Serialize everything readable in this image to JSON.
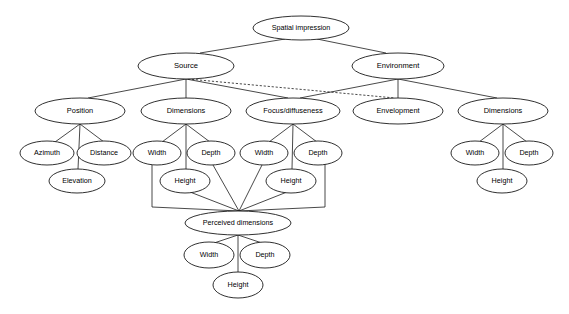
{
  "diagram": {
    "title": "Spatial impression",
    "type": "hierarchy-tree",
    "background_color": "#ffffff",
    "stroke_color": "#1a1a1a",
    "node_fill": "#ffffff",
    "nodes": [
      {
        "id": "spatial-impression",
        "label": "Spatial impression",
        "cx": 301,
        "cy": 28,
        "rx": 48,
        "ry": 12,
        "font_size": 7.2,
        "level": 0
      },
      {
        "id": "source",
        "label": "Source",
        "cx": 186,
        "cy": 66,
        "rx": 48,
        "ry": 13,
        "font_size": 7.6,
        "level": 1
      },
      {
        "id": "environment",
        "label": "Environment",
        "cx": 398,
        "cy": 66,
        "rx": 46,
        "ry": 13,
        "font_size": 7.6,
        "level": 1
      },
      {
        "id": "position",
        "label": "Position",
        "cx": 80,
        "cy": 111,
        "rx": 45,
        "ry": 13,
        "font_size": 7.4,
        "level": 2
      },
      {
        "id": "source-dimensions",
        "label": "Dimensions",
        "cx": 186,
        "cy": 111,
        "rx": 45,
        "ry": 13,
        "font_size": 7.4,
        "level": 2
      },
      {
        "id": "focus-diffuseness",
        "label": "Focus/diffuseness",
        "cx": 293,
        "cy": 111,
        "rx": 47,
        "ry": 13,
        "font_size": 7.4,
        "level": 2
      },
      {
        "id": "envelopment",
        "label": "Envelopment",
        "cx": 398,
        "cy": 111,
        "rx": 45,
        "ry": 13,
        "font_size": 7.4,
        "level": 2
      },
      {
        "id": "env-dimensions",
        "label": "Dimensions",
        "cx": 503,
        "cy": 111,
        "rx": 45,
        "ry": 13,
        "font_size": 7.4,
        "level": 2
      },
      {
        "id": "azimuth",
        "label": "Azimuth",
        "cx": 47,
        "cy": 153,
        "rx": 27,
        "ry": 12,
        "font_size": 7.2,
        "level": 3
      },
      {
        "id": "distance",
        "label": "Distance",
        "cx": 104,
        "cy": 153,
        "rx": 27,
        "ry": 12,
        "font_size": 7.2,
        "level": 3
      },
      {
        "id": "elevation",
        "label": "Elevation",
        "cx": 77,
        "cy": 181,
        "rx": 28,
        "ry": 12,
        "font_size": 7.2,
        "level": 4
      },
      {
        "id": "src-width",
        "label": "Width",
        "cx": 157,
        "cy": 153,
        "rx": 24,
        "ry": 12,
        "font_size": 7.2,
        "level": 3
      },
      {
        "id": "src-depth",
        "label": "Depth",
        "cx": 211,
        "cy": 153,
        "rx": 24,
        "ry": 12,
        "font_size": 7.2,
        "level": 3
      },
      {
        "id": "src-height",
        "label": "Height",
        "cx": 185,
        "cy": 181,
        "rx": 25,
        "ry": 12,
        "font_size": 7.2,
        "level": 4
      },
      {
        "id": "foc-width",
        "label": "Width",
        "cx": 264,
        "cy": 153,
        "rx": 24,
        "ry": 12,
        "font_size": 7.2,
        "level": 3
      },
      {
        "id": "foc-depth",
        "label": "Depth",
        "cx": 318,
        "cy": 153,
        "rx": 24,
        "ry": 12,
        "font_size": 7.2,
        "level": 3
      },
      {
        "id": "foc-height",
        "label": "Height",
        "cx": 291,
        "cy": 181,
        "rx": 25,
        "ry": 12,
        "font_size": 7.2,
        "level": 4
      },
      {
        "id": "env-width",
        "label": "Width",
        "cx": 475,
        "cy": 153,
        "rx": 24,
        "ry": 12,
        "font_size": 7.2,
        "level": 3
      },
      {
        "id": "env-depth",
        "label": "Depth",
        "cx": 529,
        "cy": 153,
        "rx": 24,
        "ry": 12,
        "font_size": 7.2,
        "level": 3
      },
      {
        "id": "env-height",
        "label": "Height",
        "cx": 502,
        "cy": 181,
        "rx": 25,
        "ry": 12,
        "font_size": 7.2,
        "level": 4
      },
      {
        "id": "perceived-dimensions",
        "label": "Perceived dimensions",
        "cx": 238,
        "cy": 223,
        "rx": 53,
        "ry": 12,
        "font_size": 7.2,
        "level": 5
      },
      {
        "id": "perc-width",
        "label": "Width",
        "cx": 209,
        "cy": 255,
        "rx": 25,
        "ry": 13,
        "font_size": 7.2,
        "level": 6
      },
      {
        "id": "perc-depth",
        "label": "Depth",
        "cx": 265,
        "cy": 255,
        "rx": 25,
        "ry": 13,
        "font_size": 7.2,
        "level": 6
      },
      {
        "id": "perc-height",
        "label": "Height",
        "cx": 238,
        "cy": 285,
        "rx": 25,
        "ry": 13,
        "font_size": 7.2,
        "level": 7
      }
    ],
    "edges": [
      {
        "id": "e-si-source",
        "from": "spatial-impression",
        "to": "source",
        "style": "solid",
        "path": "M 285 39 L 200 53"
      },
      {
        "id": "e-si-environment",
        "from": "spatial-impression",
        "to": "environment",
        "style": "solid",
        "path": "M 317 39 L 386 53"
      },
      {
        "id": "e-source-position",
        "from": "source",
        "to": "position",
        "style": "solid",
        "path": "M 186 79 L 88 98"
      },
      {
        "id": "e-source-dimensions",
        "from": "source",
        "to": "source-dimensions",
        "style": "solid",
        "path": "M 186 79 L 186 98"
      },
      {
        "id": "e-source-focus",
        "from": "source",
        "to": "focus-diffuseness",
        "style": "solid",
        "path": "M 186 79 L 288 98"
      },
      {
        "id": "e-source-envelopment-dashed",
        "from": "source",
        "to": "envelopment",
        "style": "dashed",
        "path": "M 188 79 L 395 98"
      },
      {
        "id": "e-env-focus",
        "from": "environment",
        "to": "focus-diffuseness",
        "style": "solid",
        "path": "M 398 79 L 300 98"
      },
      {
        "id": "e-env-envelopment",
        "from": "environment",
        "to": "envelopment",
        "style": "solid",
        "path": "M 398 79 L 398 98"
      },
      {
        "id": "e-env-dimensions",
        "from": "environment",
        "to": "env-dimensions",
        "style": "solid",
        "path": "M 398 79 L 497 98"
      },
      {
        "id": "e-position-azimuth",
        "from": "position",
        "to": "azimuth",
        "style": "solid",
        "path": "M 80 124 L 55 142"
      },
      {
        "id": "e-position-distance",
        "from": "position",
        "to": "distance",
        "style": "solid",
        "path": "M 80 124 L 104 142"
      },
      {
        "id": "e-position-elevation",
        "from": "position",
        "to": "elevation",
        "style": "solid",
        "path": "M 80 124 L 78 169"
      },
      {
        "id": "e-srcdim-width",
        "from": "source-dimensions",
        "to": "src-width",
        "style": "solid",
        "path": "M 186 124 L 162 142"
      },
      {
        "id": "e-srcdim-depth",
        "from": "source-dimensions",
        "to": "src-depth",
        "style": "solid",
        "path": "M 186 124 L 210 142"
      },
      {
        "id": "e-srcdim-height",
        "from": "source-dimensions",
        "to": "src-height",
        "style": "solid",
        "path": "M 186 124 L 186 169"
      },
      {
        "id": "e-focus-width",
        "from": "focus-diffuseness",
        "to": "foc-width",
        "style": "solid",
        "path": "M 293 124 L 269 142"
      },
      {
        "id": "e-focus-depth",
        "from": "focus-diffuseness",
        "to": "foc-depth",
        "style": "solid",
        "path": "M 293 124 L 317 142"
      },
      {
        "id": "e-focus-height",
        "from": "focus-diffuseness",
        "to": "foc-height",
        "style": "solid",
        "path": "M 293 124 L 292 169"
      },
      {
        "id": "e-envdim-width",
        "from": "env-dimensions",
        "to": "env-width",
        "style": "solid",
        "path": "M 503 124 L 479 142"
      },
      {
        "id": "e-envdim-depth",
        "from": "env-dimensions",
        "to": "env-depth",
        "style": "solid",
        "path": "M 503 124 L 527 142"
      },
      {
        "id": "e-envdim-height",
        "from": "env-dimensions",
        "to": "env-height",
        "style": "solid",
        "path": "M 503 124 L 503 169"
      },
      {
        "id": "e-srcwidth-perceived",
        "from": "src-width",
        "to": "perceived-dimensions",
        "style": "solid",
        "path": "M 152 164 L 152 207 L 239 211"
      },
      {
        "id": "e-srcdepth-perceived",
        "from": "src-depth",
        "to": "perceived-dimensions",
        "style": "solid",
        "path": "M 213 165 L 239 211"
      },
      {
        "id": "e-srcheight-perceived",
        "from": "src-height",
        "to": "perceived-dimensions",
        "style": "solid",
        "path": "M 190 192 L 239 211"
      },
      {
        "id": "e-focwidth-perceived",
        "from": "foc-width",
        "to": "perceived-dimensions",
        "style": "solid",
        "path": "M 262 165 L 239 211"
      },
      {
        "id": "e-focdepth-perceived",
        "from": "foc-depth",
        "to": "perceived-dimensions",
        "style": "solid",
        "path": "M 325 164 L 325 207 L 239 211"
      },
      {
        "id": "e-focheight-perceived",
        "from": "foc-height",
        "to": "perceived-dimensions",
        "style": "solid",
        "path": "M 287 192 L 239 211"
      },
      {
        "id": "e-perceived-width",
        "from": "perceived-dimensions",
        "to": "perc-width",
        "style": "solid",
        "path": "M 238 235 L 214 243"
      },
      {
        "id": "e-perceived-depth",
        "from": "perceived-dimensions",
        "to": "perc-depth",
        "style": "solid",
        "path": "M 238 235 L 262 243"
      },
      {
        "id": "e-perceived-height",
        "from": "perceived-dimensions",
        "to": "perc-height",
        "style": "solid",
        "path": "M 238 235 L 238 273"
      }
    ]
  }
}
